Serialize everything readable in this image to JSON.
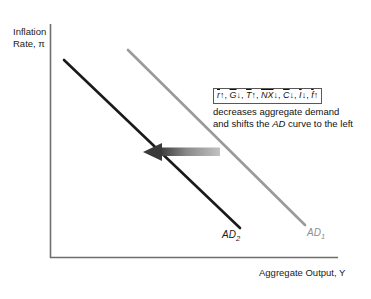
{
  "chart_data": {
    "type": "line",
    "title": "",
    "xlabel": "Aggregate Output, Y",
    "ylabel": "Inflation Rate, π",
    "grid": false,
    "legend_position": "inline-curve-labels",
    "axes": {
      "origin_px": [
        50,
        258
      ],
      "x_axis_end_px": [
        338,
        258
      ],
      "y_axis_top_px": [
        50,
        24
      ],
      "axis_color": "#6e6e6e"
    },
    "series": [
      {
        "name": "AD₂",
        "label": "AD",
        "subscript": "2",
        "color": "#1a1a1a",
        "width_px": 2.6,
        "x": [
          64,
          240
        ],
        "y": [
          60,
          228
        ],
        "description": "New aggregate demand curve after leftward shift"
      },
      {
        "name": "AD₁",
        "label": "AD",
        "subscript": "1",
        "color": "#9a9a9a",
        "width_px": 2.6,
        "x": [
          128,
          305
        ],
        "y": [
          50,
          225
        ],
        "description": "Original aggregate demand curve"
      }
    ],
    "annotations": [
      {
        "type": "arrow",
        "name": "leftward-shift-arrow",
        "direction": "left",
        "from_px": [
          220,
          152
        ],
        "to_px": [
          145,
          152
        ],
        "color_head": "#3a3a3a",
        "color_tail": "#b5b5b5"
      }
    ]
  },
  "axis": {
    "y_label_line1": "Inflation",
    "y_label_line2": "Rate, π",
    "x_label": "Aggregate Output, Y"
  },
  "curves": {
    "ad2": {
      "label": "AD",
      "subscript": "2",
      "color": "#1a1a1a"
    },
    "ad1": {
      "label": "AD",
      "subscript": "1",
      "color": "#8e8e8e"
    }
  },
  "callout": {
    "formula_terms": [
      {
        "symbol": "r",
        "arrow": "↑"
      },
      {
        "symbol": "G",
        "arrow": "↓"
      },
      {
        "symbol": "T",
        "arrow": "↑"
      },
      {
        "symbol": "NX",
        "arrow": "↓"
      },
      {
        "symbol": "C",
        "arrow": "↓"
      },
      {
        "symbol": "I",
        "arrow": "↓"
      },
      {
        "symbol": "f",
        "arrow": "↑"
      }
    ],
    "body_before": "decreases aggregate demand and shifts the ",
    "body_emphasis": "AD",
    "body_after": " curve to the left"
  }
}
